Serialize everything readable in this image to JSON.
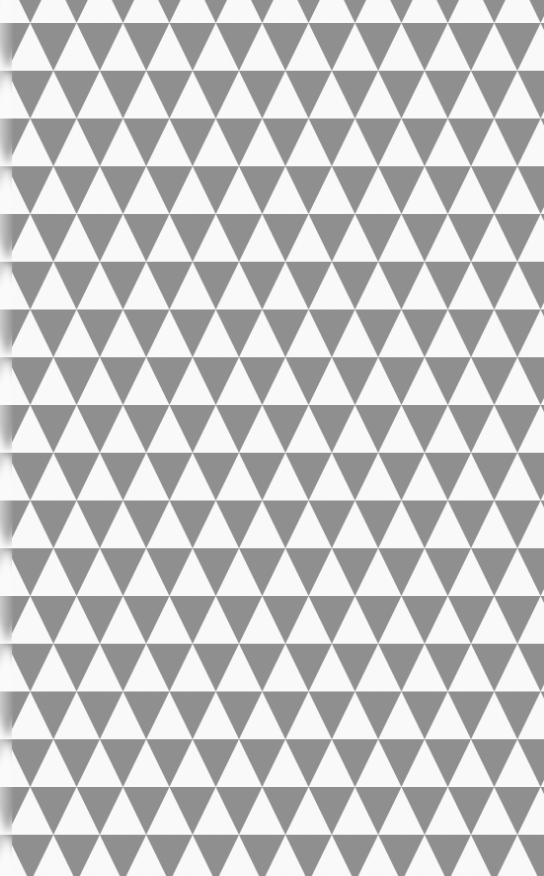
{
  "image": {
    "title": "Gray triangle geometric pattern",
    "description": "Repeating rows of alternating gray and white equilateral-ish triangles",
    "width": 544,
    "height": 876
  },
  "pattern": {
    "type": "triangles",
    "triangle_color": "#8f8f8f",
    "background_color": "#fafafa",
    "horizontal_period": 46.4,
    "row_height": 47.75,
    "first_row_top": 23,
    "even_row_tip_offset": 7,
    "odd_row_tip_offset": 30.2
  },
  "left_edge": {
    "effect": "blurred binding strip",
    "width": 12
  }
}
